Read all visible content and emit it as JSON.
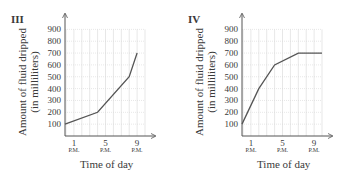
{
  "chart_data": [
    {
      "type": "line",
      "label": "III",
      "title": "III",
      "xlabel": "Time of day",
      "ylabel": "Amount of fluid dripped (in milliliters)",
      "ylabel_line1": "Amount of fluid dripped",
      "ylabel_line2": "(in milliliters)",
      "yticks": [
        "100",
        "200",
        "300",
        "400",
        "500",
        "600",
        "700",
        "800",
        "900"
      ],
      "xticks": [
        {
          "hour": "1",
          "suffix": "P.M."
        },
        {
          "hour": "5",
          "suffix": "P.M."
        },
        {
          "hour": "9",
          "suffix": "P.M."
        }
      ],
      "ylim": [
        0,
        900
      ],
      "grid": true,
      "x": [
        0,
        4,
        8,
        9
      ],
      "x_labels": [
        "12 P.M.",
        "4 P.M.",
        "8 P.M.",
        "9 P.M."
      ],
      "values": [
        100,
        200,
        500,
        700
      ]
    },
    {
      "type": "line",
      "label": "IV",
      "title": "IV",
      "xlabel": "Time of day",
      "ylabel": "Amount of fluid dripped (in milliliters)",
      "ylabel_line1": "Amount of fluid dripped",
      "ylabel_line2": "(in milliliters)",
      "yticks": [
        "100",
        "200",
        "300",
        "400",
        "500",
        "600",
        "700",
        "800",
        "900"
      ],
      "xticks": [
        {
          "hour": "1",
          "suffix": "P.M."
        },
        {
          "hour": "5",
          "suffix": "P.M."
        },
        {
          "hour": "9",
          "suffix": "P.M."
        }
      ],
      "ylim": [
        0,
        900
      ],
      "grid": true,
      "x": [
        0,
        2,
        4,
        7,
        10
      ],
      "x_labels": [
        "12 P.M.",
        "2 P.M.",
        "4 P.M.",
        "7 P.M.",
        "10 P.M."
      ],
      "values": [
        100,
        400,
        600,
        700,
        700
      ]
    }
  ]
}
